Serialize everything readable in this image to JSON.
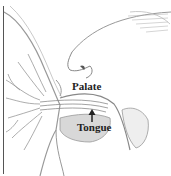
{
  "figure": {
    "labels": {
      "palate": "Palate",
      "tongue": "Tongue"
    },
    "arrow": "up-arrow"
  }
}
